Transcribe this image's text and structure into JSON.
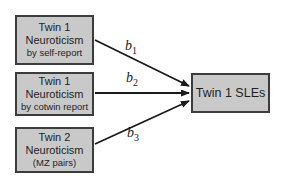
{
  "diagram": {
    "type": "path-diagram",
    "predictors": [
      {
        "line1": "Twin 1",
        "line2": "Neuroticism",
        "line3": "by self-report"
      },
      {
        "line1": "Twin 1",
        "line2": "Neuroticism",
        "line3": "by cotwin report"
      },
      {
        "line1": "Twin 2",
        "line2": "Neuroticism",
        "line3": "(MZ pairs)"
      }
    ],
    "outcome": {
      "label": "Twin 1 SLEs"
    },
    "path_labels": [
      {
        "base": "b",
        "sub": "1"
      },
      {
        "base": "b",
        "sub": "2"
      },
      {
        "base": "b",
        "sub": "3"
      }
    ],
    "colors": {
      "node_fill": "#c9c9c9",
      "node_border": "#3c3c3c",
      "arrow": "#1a1a1a",
      "background": "#ffffff",
      "text": "#1f1f1f"
    }
  }
}
